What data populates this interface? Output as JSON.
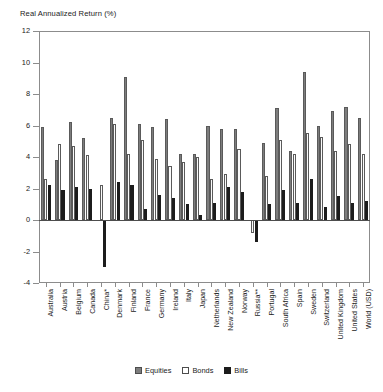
{
  "chart_data": {
    "type": "bar",
    "title": "Real Annualized Return (%)",
    "xlabel": "",
    "ylabel": "Real Annualized Return (%)",
    "ylim": [
      -4,
      12
    ],
    "yticks": [
      -4,
      -2,
      0,
      2,
      4,
      6,
      8,
      10,
      12
    ],
    "ytick_labels": [
      "-4",
      "-2",
      "0",
      "2",
      "4",
      "6",
      "8",
      "10",
      "12"
    ],
    "grid": false,
    "legend_position": "bottom-center",
    "categories": [
      "Australia",
      "Austria",
      "Belgium",
      "Canada",
      "China*",
      "Denmark",
      "Finland",
      "France",
      "Germany",
      "Ireland",
      "Italy",
      "Japan",
      "Netherlands",
      "New Zealand",
      "Norway",
      "Russia**",
      "Portugal",
      "South Africa",
      "Spain",
      "Sweden",
      "Switzerland",
      "United Kingdom",
      "United States",
      "World (USD)"
    ],
    "series": [
      {
        "name": "Equities",
        "color": "#7d7d7d",
        "values": [
          5.9,
          3.8,
          6.2,
          5.2,
          0.0,
          6.5,
          9.1,
          6.1,
          5.9,
          6.4,
          4.2,
          4.2,
          6.0,
          5.8,
          5.8,
          0.0,
          4.9,
          7.1,
          4.4,
          9.4,
          6.0,
          6.9,
          7.2,
          6.5
        ],
        "bills_note": ""
      },
      {
        "name": "Bonds",
        "color": "#ffffff",
        "values": [
          2.6,
          4.8,
          4.7,
          4.1,
          2.2,
          6.1,
          4.2,
          5.1,
          3.9,
          3.4,
          3.7,
          4.0,
          2.6,
          2.9,
          4.5,
          -0.8,
          2.8,
          5.1,
          4.2,
          5.5,
          5.3,
          4.4,
          4.8,
          4.2
        ],
        "bills_note": ""
      },
      {
        "name": "Bills",
        "color": "#1c1c1c",
        "values": [
          2.2,
          1.9,
          2.1,
          2.0,
          -3.0,
          2.4,
          2.2,
          0.7,
          1.6,
          1.4,
          1.0,
          0.3,
          1.1,
          2.1,
          1.8,
          -1.4,
          1.0,
          1.9,
          1.1,
          2.6,
          0.8,
          1.5,
          1.1,
          1.2
        ],
        "bills_note": ""
      }
    ]
  },
  "legend": {
    "items": [
      {
        "label": "Equities",
        "swatch": "equities"
      },
      {
        "label": "Bonds",
        "swatch": "bonds"
      },
      {
        "label": "Bills",
        "swatch": "bills"
      }
    ]
  },
  "colors": {
    "equities": "#7d7d7d",
    "bonds": "#ffffff",
    "bills": "#1c1c1c",
    "axis": "#8c8c8c",
    "text": "#1a1a1a"
  }
}
